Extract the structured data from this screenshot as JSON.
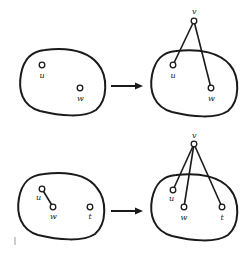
{
  "diagram": {
    "type": "graph-transformation",
    "panels": [
      {
        "id": "top-left",
        "vertices": [
          {
            "id": "u",
            "label": "u"
          },
          {
            "id": "w",
            "label": "w"
          }
        ],
        "edges": []
      },
      {
        "id": "top-right",
        "vertices": [
          {
            "id": "v",
            "label": "v"
          },
          {
            "id": "u",
            "label": "u"
          },
          {
            "id": "w",
            "label": "w"
          }
        ],
        "edges": [
          [
            "v",
            "u"
          ],
          [
            "v",
            "w"
          ]
        ]
      },
      {
        "id": "bottom-left",
        "vertices": [
          {
            "id": "u",
            "label": "u"
          },
          {
            "id": "w",
            "label": "w"
          },
          {
            "id": "t",
            "label": "t"
          }
        ],
        "edges": [
          [
            "u",
            "w"
          ]
        ]
      },
      {
        "id": "bottom-right",
        "vertices": [
          {
            "id": "v",
            "label": "v"
          },
          {
            "id": "u",
            "label": "u"
          },
          {
            "id": "w",
            "label": "w"
          },
          {
            "id": "t",
            "label": "t"
          }
        ],
        "edges": [
          [
            "v",
            "u"
          ],
          [
            "v",
            "w"
          ],
          [
            "v",
            "t"
          ]
        ]
      }
    ],
    "arrows": [
      {
        "from": "top-left",
        "to": "top-right"
      },
      {
        "from": "bottom-left",
        "to": "bottom-right"
      }
    ],
    "labels": {
      "tl_u": "u",
      "tl_w": "w",
      "tr_v": "v",
      "tr_u": "u",
      "tr_w": "w",
      "bl_u": "u",
      "bl_w": "w",
      "bl_t": "t",
      "br_v": "v",
      "br_u": "u",
      "br_w": "w",
      "br_t": "t"
    },
    "colors": {
      "stroke": "#1a1a1a",
      "background": "#ffffff"
    }
  }
}
